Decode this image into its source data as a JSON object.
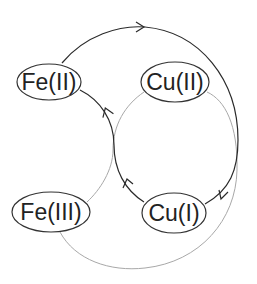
{
  "nodes": {
    "fe2": {
      "label": "Fe(II)"
    },
    "cu2": {
      "label": "Cu(II)"
    },
    "fe3": {
      "label": "Fe(III)"
    },
    "cu1": {
      "label": "Cu(I)"
    }
  },
  "colors": {
    "dark_cycle": "#2a2a2a",
    "light_cycle": "#a8a8a8",
    "node_stroke": "#333333",
    "background": "#ffffff"
  },
  "edges": [
    {
      "from": "Fe(II)",
      "to": "Cu(I)",
      "style": "dark",
      "arrow": "along top arc and down right side"
    },
    {
      "from": "Cu(I)",
      "to": "Fe(II)",
      "style": "dark",
      "arrow": "up left side"
    },
    {
      "from": "Cu(II)",
      "to": "Fe(III)",
      "style": "light"
    },
    {
      "from": "Fe(III)",
      "to": "Cu(II)",
      "style": "light"
    }
  ]
}
